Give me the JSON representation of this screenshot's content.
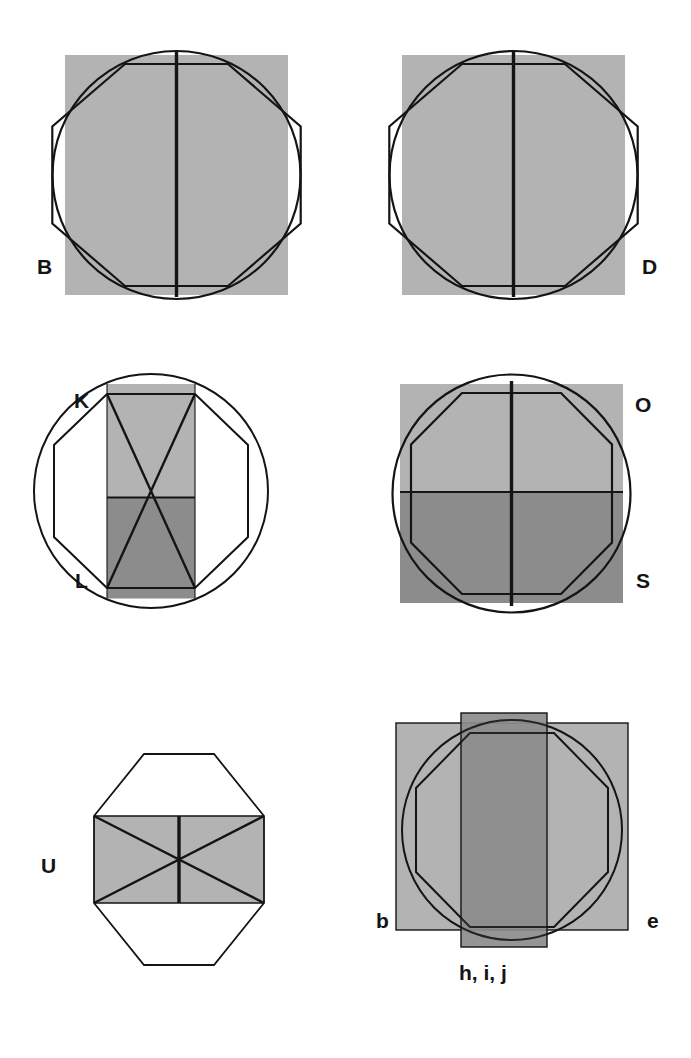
{
  "figure": {
    "background_color": "#ffffff",
    "stroke_color": "#141414",
    "light_gray": "#b3b3b3",
    "dark_gray": "#8c8c8c",
    "label_color": "#141414",
    "panels": [
      {
        "id": "panel-b",
        "labels": [
          "B"
        ],
        "label_position": "bottom-left",
        "description": "shaded square with circumscribing circle, inscribed octagon and central vertical line",
        "shapes": [
          "square-light-gray",
          "circle-outline",
          "octagon-outline",
          "vertical-midline"
        ]
      },
      {
        "id": "panel-d",
        "labels": [
          "D"
        ],
        "label_position": "bottom-right",
        "description": "shaded square with circle, inscribed octagon and central vertical line",
        "shapes": [
          "square-light-gray",
          "circle-outline",
          "octagon-outline",
          "vertical-midline"
        ]
      },
      {
        "id": "panel-kl",
        "labels": [
          "K",
          "L"
        ],
        "label_position": "left-top-and-left-bottom",
        "description": "circle with inscribed octagon and a narrow vertical bar, light gray upper half and dark gray lower half, crossed by X diagonals",
        "shapes": [
          "circle-outline",
          "octagon-outline",
          "narrow-bar-light-top",
          "narrow-bar-dark-bottom",
          "x-diagonals"
        ]
      },
      {
        "id": "panel-os",
        "labels": [
          "O",
          "S"
        ],
        "label_position": "right-top-and-right-bottom",
        "description": "square split horizontally into light gray top and dark gray bottom, with circle, octagon, vertical midline and horizontal midline",
        "shapes": [
          "square-light-top",
          "square-dark-bottom",
          "circle-outline",
          "octagon-outline",
          "vertical-midline",
          "horizontal-midline"
        ]
      },
      {
        "id": "panel-u",
        "labels": [
          "U"
        ],
        "label_position": "left-bottom",
        "description": "octagon outline with a horizontal light gray band through the middle, crossed by X diagonals and a short vertical line",
        "shapes": [
          "octagon-outline",
          "horizontal-band-light",
          "x-diagonals",
          "short-vertical-line"
        ]
      },
      {
        "id": "panel-bej",
        "labels": [
          "b",
          "e"
        ],
        "caption": "h, i, j",
        "label_position": "bottom-left-and-bottom-right",
        "description": "light gray square overlapped by a tall narrow dark gray rectangle, with circle and octagon outlines",
        "shapes": [
          "square-light-gray",
          "tall-narrow-rect-dark",
          "circle-outline",
          "octagon-outline"
        ]
      }
    ]
  }
}
